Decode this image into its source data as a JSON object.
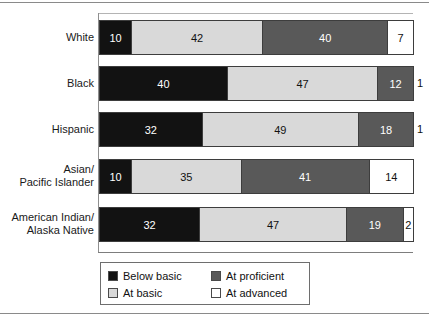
{
  "chart_data": {
    "type": "bar",
    "orientation": "horizontal",
    "stacked": true,
    "stack_total": 100,
    "title": "",
    "subtitle": "",
    "xlabel": "",
    "ylabel": "",
    "xlim": [
      0,
      100
    ],
    "grid": false,
    "legend_position": "bottom",
    "categories": [
      "White",
      "Black",
      "Hispanic",
      "Asian/\nPacific Islander",
      "American Indian/\nAlaska Native"
    ],
    "series": [
      {
        "name": "Below basic",
        "color": "#121212",
        "values": [
          10,
          40,
          32,
          10,
          32
        ]
      },
      {
        "name": "At basic",
        "color": "#d9d9d9",
        "values": [
          42,
          47,
          49,
          35,
          47
        ]
      },
      {
        "name": "At proficient",
        "color": "#595959",
        "values": [
          40,
          12,
          18,
          41,
          19
        ]
      },
      {
        "name": "At advanced",
        "color": "#ffffff",
        "values": [
          7,
          1,
          1,
          14,
          2
        ]
      }
    ],
    "legend": [
      {
        "label": "Below basic",
        "color": "#121212"
      },
      {
        "label": "At proficient",
        "color": "#595959"
      },
      {
        "label": "At basic",
        "color": "#d9d9d9"
      },
      {
        "label": "At advanced",
        "color": "#ffffff"
      }
    ]
  },
  "rows": [
    {
      "label": "White",
      "segments": [
        {
          "key": "below",
          "value": "10",
          "pct": 10,
          "inside": true
        },
        {
          "key": "basic",
          "value": "42",
          "pct": 42,
          "inside": true
        },
        {
          "key": "prof",
          "value": "40",
          "pct": 40,
          "inside": true
        },
        {
          "key": "adv",
          "value": "7",
          "pct": 8,
          "inside": true
        }
      ]
    },
    {
      "label": "Black",
      "segments": [
        {
          "key": "below",
          "value": "40",
          "pct": 40,
          "inside": true
        },
        {
          "key": "basic",
          "value": "47",
          "pct": 47,
          "inside": true
        },
        {
          "key": "prof",
          "value": "12",
          "pct": 11,
          "inside": true
        },
        {
          "key": "adv",
          "value": "1",
          "pct": 2,
          "inside": false
        }
      ]
    },
    {
      "label": "Hispanic",
      "segments": [
        {
          "key": "below",
          "value": "32",
          "pct": 32,
          "inside": true
        },
        {
          "key": "basic",
          "value": "49",
          "pct": 49,
          "inside": true
        },
        {
          "key": "prof",
          "value": "18",
          "pct": 17,
          "inside": true
        },
        {
          "key": "adv",
          "value": "1",
          "pct": 2,
          "inside": false
        }
      ]
    },
    {
      "label": "Asian/\nPacific Islander",
      "segments": [
        {
          "key": "below",
          "value": "10",
          "pct": 10,
          "inside": true
        },
        {
          "key": "basic",
          "value": "35",
          "pct": 35,
          "inside": true
        },
        {
          "key": "prof",
          "value": "41",
          "pct": 41,
          "inside": true
        },
        {
          "key": "adv",
          "value": "14",
          "pct": 14,
          "inside": true
        }
      ]
    },
    {
      "label": "American Indian/\nAlaska Native",
      "segments": [
        {
          "key": "below",
          "value": "32",
          "pct": 32,
          "inside": true
        },
        {
          "key": "basic",
          "value": "47",
          "pct": 47,
          "inside": true
        },
        {
          "key": "prof",
          "value": "19",
          "pct": 18,
          "inside": true
        },
        {
          "key": "adv",
          "value": "2",
          "pct": 3,
          "inside": true
        }
      ]
    }
  ],
  "legend": {
    "items": [
      {
        "key": "below",
        "label": "Below basic"
      },
      {
        "key": "prof",
        "label": "At proficient"
      },
      {
        "key": "basic",
        "label": "At basic"
      },
      {
        "key": "adv",
        "label": "At advanced"
      }
    ]
  }
}
